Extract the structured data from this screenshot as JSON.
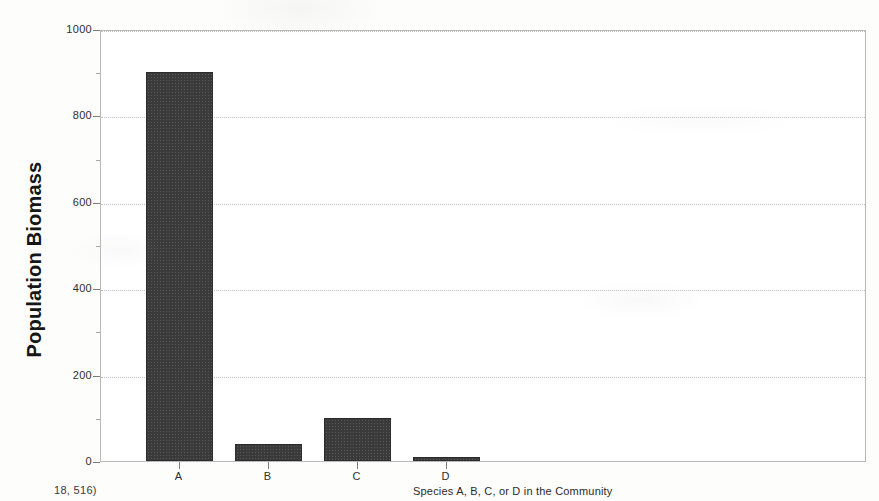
{
  "figure": {
    "background_color": "#fdfdfc",
    "frame_color": "#b9b9b9",
    "bar_color": "#3a3a3a"
  },
  "labels": {
    "y_axis_title": "Population Biomass",
    "x_axis_title": "Species A, B, C, or D in the Community",
    "page_fragment": "18, 516)"
  },
  "chart_data": {
    "type": "bar",
    "title": "",
    "subtitle": "",
    "xlabel": "Species A, B, C, or D in the Community",
    "ylabel": "Population Biomass",
    "categories": [
      "A",
      "B",
      "C",
      "D"
    ],
    "values": [
      900,
      40,
      100,
      10
    ],
    "series": [
      {
        "name": "Population Biomass",
        "values": [
          900,
          40,
          100,
          10
        ],
        "color": "#3a3a3a"
      }
    ],
    "ylim": [
      0,
      1000
    ],
    "y_major_ticks": [
      0,
      200,
      400,
      600,
      800,
      1000
    ],
    "y_minor_ticks": [
      100,
      300,
      500,
      700,
      900
    ],
    "y_tick_labels": [
      "0",
      "200",
      "400",
      "600",
      "800",
      "1000"
    ],
    "x_tick_labels": [
      "A",
      "B",
      "C",
      "D"
    ],
    "grid": true,
    "grid_axis": "y",
    "grid_style": "dotted",
    "legend": false,
    "legend_position": "none",
    "bar_width_px": 67,
    "bar_left_positions_px": [
      145,
      234,
      323,
      412
    ],
    "plot_area_px": {
      "left": 100,
      "top": 30,
      "width": 766,
      "height": 432
    }
  }
}
